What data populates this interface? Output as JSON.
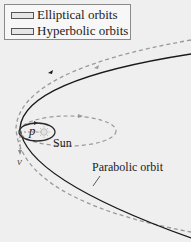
{
  "legend": {
    "items": [
      {
        "label": "Elliptical orbits"
      },
      {
        "label": "Hyperbolic orbits"
      }
    ]
  },
  "labels": {
    "sun": "Sun",
    "perihelion": "p",
    "velocity": "v",
    "parabolic": "Parabolic orbit"
  },
  "colors": {
    "background": "#efefef",
    "parabolic_orbit": "#1a1a1a",
    "hyperbolic_orbit": "#9a9a9a",
    "elliptical_orbit_small": "#2a2a2a",
    "elliptical_orbit_large": "#9a9a9a",
    "sun": "#d8d8d8"
  }
}
